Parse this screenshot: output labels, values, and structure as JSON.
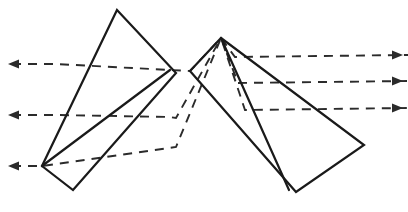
{
  "figure": {
    "type": "optical-diagram",
    "width": 408,
    "height": 212,
    "background_color": "#ffffff",
    "line_color": "#1a1a1a",
    "ray_color": "#2b2b2b",
    "stroke_width": 2.2,
    "ray_stroke_width": 1.9,
    "ray_dash_pattern": "9 7"
  },
  "elements": {
    "prisms": [
      {
        "name": "left-prism",
        "label": "Left prism",
        "shape": "quadrilateral",
        "vertices": [
          [
            117,
            10
          ],
          [
            176,
            73
          ],
          [
            73,
            190
          ],
          [
            42,
            166
          ]
        ],
        "points_string": "117,10 176,73 73,190 42,166"
      },
      {
        "name": "left-prism-inner-edge",
        "label": "Left prism inner edge",
        "shape": "line",
        "vertices": [
          [
            42,
            166
          ],
          [
            170,
            70
          ]
        ],
        "points_string": "42,166 170,70"
      },
      {
        "name": "right-prism",
        "label": "Right prism",
        "shape": "quadrilateral",
        "vertices": [
          [
            221,
            38
          ],
          [
            364,
            145
          ],
          [
            296,
            192
          ],
          [
            190,
            71
          ]
        ],
        "points_string": "221,38 364,145 296,192 190,71"
      },
      {
        "name": "right-prism-inner-edge",
        "label": "Right prism inner edge",
        "shape": "line",
        "vertices": [
          [
            221,
            38
          ],
          [
            289,
            190
          ]
        ],
        "points_string": "221,38 289,190"
      }
    ],
    "rays": [
      {
        "name": "ray-upper",
        "label": "Upper ray path",
        "points_string": "12,64 56,64 170,70 190,71 221,38 235,57 408,55",
        "incoming_y": 64,
        "outgoing_y": 55
      },
      {
        "name": "ray-middle",
        "label": "Middle ray path",
        "points_string": "12,115 56,115 170,117 176,118 221,38 238,83 408,81",
        "incoming_y": 115,
        "outgoing_y": 81
      },
      {
        "name": "ray-lower",
        "label": "Lower ray path",
        "points_string": "12,166 42,166 176,147 221,38 245,110 408,108",
        "incoming_y": 166,
        "outgoing_y": 108
      }
    ],
    "arrows_in": [
      {
        "name": "arrow-in-upper",
        "label": "Incoming upper ray arrowhead",
        "direction": "left",
        "tip": [
          8,
          64
        ]
      },
      {
        "name": "arrow-in-middle",
        "label": "Incoming middle ray arrowhead",
        "direction": "left",
        "tip": [
          8,
          115
        ]
      },
      {
        "name": "arrow-in-lower",
        "label": "Incoming lower ray arrowhead",
        "direction": "left",
        "tip": [
          8,
          166
        ]
      }
    ],
    "arrows_out": [
      {
        "name": "arrow-out-upper",
        "label": "Outgoing upper ray arrowhead",
        "direction": "right",
        "tip": [
          403,
          55
        ]
      },
      {
        "name": "arrow-out-middle",
        "label": "Outgoing middle ray arrowhead",
        "direction": "right",
        "tip": [
          403,
          81
        ]
      },
      {
        "name": "arrow-out-lower",
        "label": "Outgoing lower ray arrowhead",
        "direction": "right",
        "tip": [
          403,
          108
        ]
      }
    ]
  }
}
